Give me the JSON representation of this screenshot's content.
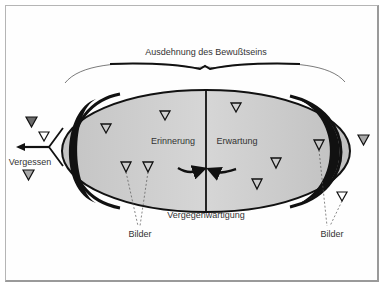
{
  "title": "Ausdehnung des Bewußtseins",
  "regions": {
    "left": "Erinnerung",
    "right": "Erwartung"
  },
  "center_label": "Vergegenwärtigung",
  "forgetting_label": "Vergessen",
  "images_label_left": "Bilder",
  "images_label_right": "Bilder",
  "colors": {
    "ellipse_fill": "#c8c8c8",
    "ellipse_edge": "#111111",
    "frame": "#b5b5b5",
    "triangle_dark": "#6a6a6a",
    "triangle_grey": "#a8a8a8",
    "text": "#333333"
  },
  "triangles": {
    "inside_left": 4,
    "inside_right": 4,
    "outside_left": 3,
    "outside_right": 2
  }
}
